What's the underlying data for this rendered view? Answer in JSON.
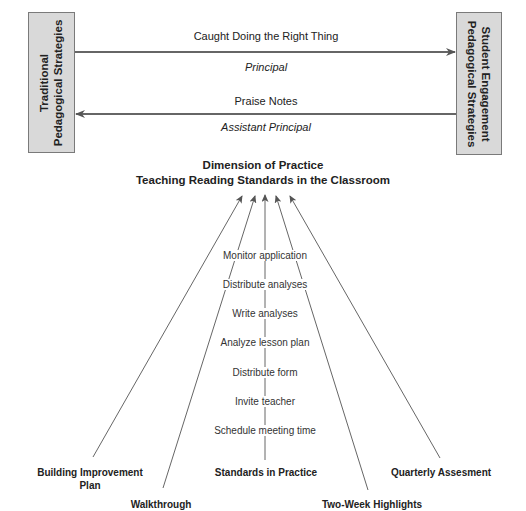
{
  "boxes": {
    "left": {
      "line1": "Traditional",
      "line2": "Pedagogical Strategies"
    },
    "right": {
      "line1": "Student Engagement",
      "line2": "Pedagogical Strategies"
    }
  },
  "arrows": {
    "top": {
      "label": "Caught Doing the Right Thing",
      "actor": "Principal",
      "direction": "left-to-right"
    },
    "bottom": {
      "label": "Praise Notes",
      "actor": "Assistant Principal",
      "direction": "right-to-left"
    }
  },
  "dimension": {
    "title_line1": "Dimension of Practice",
    "title_line2": "Teaching Reading Standards in the Classroom"
  },
  "steps": [
    "Monitor application",
    "Distribute analyses",
    "Write analyses",
    "Analyze lesson plan",
    "Distribute form",
    "Invite teacher",
    "Schedule meeting time"
  ],
  "sources": [
    {
      "id": "building",
      "line1": "Building Improvement",
      "line2": "Plan"
    },
    {
      "id": "walkthrough",
      "line1": "Walkthrough",
      "line2": ""
    },
    {
      "id": "standards",
      "line1": "Standards in Practice",
      "line2": ""
    },
    {
      "id": "twoweek",
      "line1": "Two-Week Highlights",
      "line2": ""
    },
    {
      "id": "quarterly",
      "line1": "Quarterly Assesment",
      "line2": ""
    }
  ],
  "colors": {
    "box_fill": "#d9d9d9",
    "line": "#666666"
  }
}
